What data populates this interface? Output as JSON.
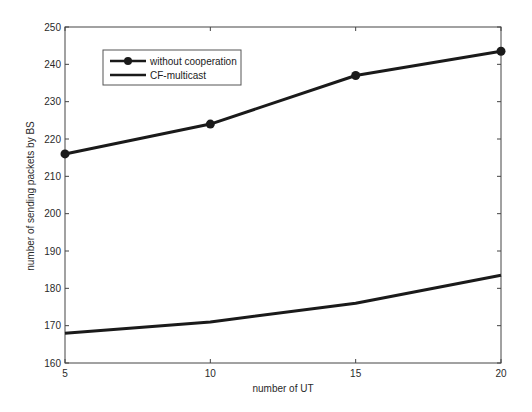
{
  "chart_data": {
    "type": "line",
    "title": "",
    "xlabel": "number of UT",
    "ylabel": "number of sending packets by BS",
    "x": [
      5,
      10,
      15,
      20
    ],
    "xticks": [
      5,
      10,
      15,
      20
    ],
    "yticks": [
      160,
      170,
      180,
      190,
      200,
      210,
      220,
      230,
      240,
      250
    ],
    "xlim": [
      5,
      20
    ],
    "ylim": [
      160,
      250
    ],
    "grid": false,
    "legend_position": "upper left",
    "series": [
      {
        "name": "without cooperation",
        "values": [
          216,
          224,
          237,
          243.5
        ],
        "marker": "circle",
        "color": "#1a1a1a"
      },
      {
        "name": "CF-multicast",
        "values": [
          168,
          171,
          176,
          183.5
        ],
        "marker": "none",
        "color": "#1a1a1a"
      }
    ]
  },
  "legend": {
    "items": [
      {
        "label": "without cooperation"
      },
      {
        "label": "CF-multicast"
      }
    ]
  }
}
